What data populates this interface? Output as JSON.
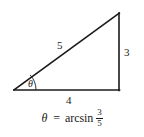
{
  "figure": {
    "kind": "right-triangle-diagram",
    "background_color": "#ffffff",
    "stroke_color": "#1a1a1a",
    "width": 144,
    "height": 137
  },
  "triangle": {
    "vertices": {
      "left": {
        "x": 14,
        "y": 90
      },
      "bottom_right": {
        "x": 119,
        "y": 90
      },
      "top": {
        "x": 119,
        "y": 13
      }
    },
    "angle_arc": {
      "at_vertex": "left",
      "radius": 22,
      "label": "θ"
    }
  },
  "labels": {
    "hypotenuse": "5",
    "opposite": "3",
    "adjacent": "4",
    "angle": "θ"
  },
  "caption": {
    "theta": "θ",
    "equals": "=",
    "function": "arcsin",
    "fraction": {
      "numerator": "3",
      "denominator": "5"
    },
    "plain_text": "θ = arcsin 3/5"
  }
}
